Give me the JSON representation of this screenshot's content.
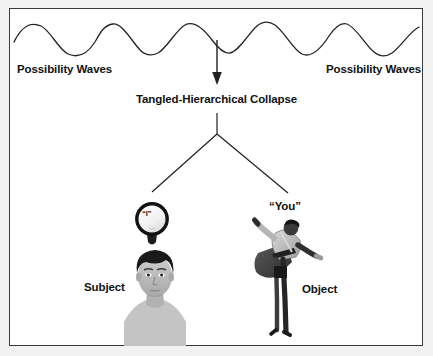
{
  "figure": {
    "background_color": "#ffffff",
    "outer_color": "#f2f2f2",
    "border_color": "#3a3a3a",
    "ink_color": "#111111"
  },
  "labels": {
    "waves_left": "Possibility Waves",
    "waves_right": "Possibility Waves",
    "collapse": "Tangled-Hierarchical Collapse",
    "subject": "Subject",
    "object": "Object",
    "quoted_i": "“I”",
    "quoted_you": "“You”"
  },
  "graphics": {
    "wave": {
      "name": "possibility-wave",
      "amplitude": 12,
      "wavelength": 72,
      "baseline_y": 38,
      "x_start": 14,
      "x_end": 420,
      "stroke": "#222222",
      "stroke_width": 1.3
    },
    "collapse_arrow": {
      "name": "downward-arrow",
      "x": 217,
      "y_start": 40,
      "y_end": 84,
      "head": "filled-triangle"
    },
    "fork": {
      "name": "y-fork-connector",
      "stem_x": 217,
      "stem_top": 114,
      "stem_bottom": 134,
      "left_end_x": 152,
      "left_end_y": 192,
      "right_end_x": 287,
      "right_end_y": 193
    },
    "bulb": {
      "name": "lightbulb-with-i",
      "center_x": 152,
      "center_y": 219,
      "radius": 17
    },
    "subject_figure": {
      "name": "subject-face-portrait",
      "center_x": 155,
      "top_y": 250
    },
    "object_figure": {
      "name": "object-leaping-person",
      "center_x": 285,
      "top_y": 222
    }
  }
}
